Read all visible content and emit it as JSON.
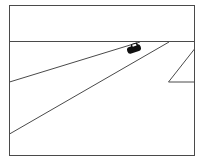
{
  "scene": {
    "description": "Line drawing of a road receding to the horizon with a car on it",
    "colors": {
      "background": "#ffffff",
      "line": "#4a4a4a",
      "car": "#111111"
    },
    "frame": {
      "x": 9,
      "y": 5,
      "width": 186,
      "height": 151
    },
    "horizon_y": 41,
    "road_left_edge": {
      "x1": 9,
      "y1": 82,
      "x2": 140,
      "y2": 42
    },
    "road_right_edge": {
      "x1": 9,
      "y1": 134,
      "x2": 169,
      "y2": 42
    },
    "side_marker": {
      "points": "195,49 168,82 195,82"
    },
    "car": {
      "cx": 134,
      "cy": 49
    }
  }
}
